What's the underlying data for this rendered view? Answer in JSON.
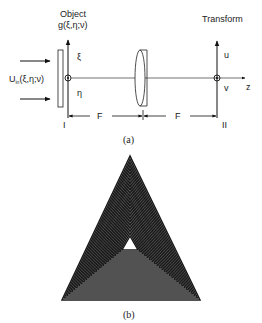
{
  "figure_a": {
    "caption": "(a)",
    "object_label": "Object",
    "object_function": "g(ξ,η;ν)",
    "input_field": "U",
    "input_field_sub": "in",
    "input_field_args": "(ξ,η;ν)",
    "transform_label": "Transform",
    "xi_axis": "ξ",
    "eta_axis": "η",
    "u_axis": "u",
    "v_axis": "v",
    "z_axis": "z",
    "focal_left": "F",
    "focal_right": "F",
    "plane_one": "I",
    "plane_two": "II"
  },
  "figure_b": {
    "caption": "(b)",
    "pattern": "nested-triangles",
    "count": 26,
    "outer": {
      "apex": [
        130,
        156
      ],
      "left": [
        62,
        300
      ],
      "right": [
        200,
        300
      ]
    },
    "inner": {
      "apex": [
        130,
        236
      ],
      "left": [
        122,
        250
      ],
      "right": [
        138,
        250
      ]
    },
    "stroke_color": "#1a1a1a"
  }
}
